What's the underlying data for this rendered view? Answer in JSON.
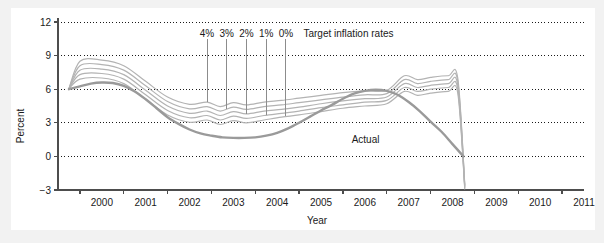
{
  "chart_data": {
    "type": "line",
    "title": "",
    "xlabel": "Year",
    "ylabel": "Percent",
    "xlim": [
      1999.5,
      2011.5
    ],
    "ylim": [
      -3,
      12
    ],
    "yticks": [
      -3,
      0,
      3,
      6,
      9,
      12
    ],
    "ytick_labels": [
      "−3",
      "0",
      "3",
      "6",
      "9",
      "12"
    ],
    "xticks": [
      2000,
      2001,
      2002,
      2003,
      2004,
      2005,
      2006,
      2007,
      2008,
      2009,
      2010,
      2011
    ],
    "xtick_labels": [
      "2000",
      "2001",
      "2002",
      "2003",
      "2004",
      "2005",
      "2006",
      "2007",
      "2008",
      "2009",
      "2010",
      "2011"
    ],
    "grid": "horizontal-dotted",
    "legend_position": "inline-annotations",
    "annotations": [
      {
        "text": "4%",
        "x": 2002.9,
        "y": 11.0
      },
      {
        "text": "3%",
        "x": 2003.35,
        "y": 11.0
      },
      {
        "text": "2%",
        "x": 2003.8,
        "y": 11.0
      },
      {
        "text": "1%",
        "x": 2004.25,
        "y": 11.0
      },
      {
        "text": "0%",
        "x": 2004.7,
        "y": 11.0
      },
      {
        "text": "Target inflation rates",
        "x": 2005.1,
        "y": 11.0
      },
      {
        "text": "Actual",
        "x": 2006.2,
        "y": 1.55
      }
    ],
    "series": [
      {
        "name": "Actual",
        "color": "#9a9a9a",
        "width": 2.4,
        "x": [
          1999.75,
          2000.0,
          2000.25,
          2000.5,
          2000.75,
          2001.0,
          2001.25,
          2001.5,
          2001.75,
          2002.0,
          2002.25,
          2002.5,
          2002.75,
          2003.0,
          2003.25,
          2003.5,
          2003.75,
          2004.0,
          2004.25,
          2004.5,
          2004.75,
          2005.0,
          2005.25,
          2005.5,
          2005.75,
          2006.0,
          2006.25,
          2006.5,
          2006.75,
          2007.0,
          2007.25,
          2007.5,
          2007.75,
          2008.0,
          2008.25,
          2008.5,
          2008.75
        ],
        "values": [
          6.0,
          6.25,
          6.5,
          6.6,
          6.55,
          6.3,
          5.8,
          5.1,
          4.3,
          3.5,
          2.9,
          2.4,
          2.05,
          1.85,
          1.7,
          1.65,
          1.65,
          1.7,
          1.85,
          2.1,
          2.5,
          3.0,
          3.55,
          4.1,
          4.6,
          5.15,
          5.6,
          5.85,
          5.95,
          5.85,
          5.5,
          4.85,
          4.05,
          3.1,
          2.2,
          1.1,
          0.0
        ]
      },
      {
        "name": "4% target path",
        "color": "#b3b3b3",
        "width": 1.2,
        "x": [
          1999.75,
          2000.0,
          2000.5,
          2001.0,
          2001.5,
          2002.0,
          2002.5,
          2002.9,
          2003.2,
          2003.5,
          2003.8,
          2004.2,
          2004.6,
          2005.0,
          2005.5,
          2006.0,
          2006.5,
          2007.0,
          2007.4,
          2007.7,
          2008.0,
          2008.4,
          2008.62,
          2008.78
        ],
        "values": [
          6.05,
          8.5,
          8.6,
          8.1,
          6.7,
          5.3,
          4.65,
          4.85,
          4.45,
          4.8,
          4.6,
          4.85,
          5.0,
          5.2,
          5.45,
          5.7,
          5.85,
          5.9,
          7.2,
          6.85,
          7.05,
          7.2,
          7.0,
          -2.5
        ]
      },
      {
        "name": "3% target path",
        "color": "#b3b3b3",
        "width": 1.2,
        "x": [
          1999.75,
          2000.0,
          2000.5,
          2001.0,
          2001.5,
          2002.0,
          2002.5,
          2002.9,
          2003.2,
          2003.5,
          2003.8,
          2004.2,
          2004.6,
          2005.0,
          2005.5,
          2006.0,
          2006.5,
          2007.0,
          2007.4,
          2007.7,
          2008.0,
          2008.4,
          2008.62,
          2008.78
        ],
        "values": [
          6.05,
          8.1,
          8.2,
          7.7,
          6.3,
          4.9,
          4.25,
          4.45,
          4.05,
          4.4,
          4.2,
          4.45,
          4.6,
          4.8,
          5.05,
          5.3,
          5.5,
          5.6,
          6.85,
          6.5,
          6.7,
          6.85,
          6.7,
          -2.6
        ]
      },
      {
        "name": "2% target path",
        "color": "#b3b3b3",
        "width": 1.2,
        "x": [
          1999.75,
          2000.0,
          2000.5,
          2001.0,
          2001.5,
          2002.0,
          2002.5,
          2002.9,
          2003.2,
          2003.5,
          2003.8,
          2004.2,
          2004.6,
          2005.0,
          2005.5,
          2006.0,
          2006.5,
          2007.0,
          2007.4,
          2007.7,
          2008.0,
          2008.4,
          2008.62,
          2008.78
        ],
        "values": [
          6.05,
          7.7,
          7.8,
          7.3,
          5.9,
          4.5,
          3.85,
          4.05,
          3.65,
          4.0,
          3.8,
          4.05,
          4.2,
          4.4,
          4.7,
          4.95,
          5.15,
          5.3,
          6.5,
          6.15,
          6.35,
          6.5,
          6.35,
          -2.7
        ]
      },
      {
        "name": "1% target path",
        "color": "#b3b3b3",
        "width": 1.2,
        "x": [
          1999.75,
          2000.0,
          2000.5,
          2001.0,
          2001.5,
          2002.0,
          2002.5,
          2002.9,
          2003.2,
          2003.5,
          2003.8,
          2004.2,
          2004.6,
          2005.0,
          2005.5,
          2006.0,
          2006.5,
          2007.0,
          2007.4,
          2007.7,
          2008.0,
          2008.4,
          2008.62,
          2008.78
        ],
        "values": [
          6.05,
          7.3,
          7.4,
          6.9,
          5.5,
          4.1,
          3.45,
          3.65,
          3.25,
          3.6,
          3.4,
          3.65,
          3.85,
          4.05,
          4.35,
          4.6,
          4.85,
          5.0,
          6.15,
          5.8,
          6.0,
          6.15,
          6.0,
          -2.8
        ]
      },
      {
        "name": "0% target path",
        "color": "#b3b3b3",
        "width": 1.2,
        "x": [
          1999.75,
          2000.0,
          2000.5,
          2001.0,
          2001.5,
          2002.0,
          2002.5,
          2002.9,
          2003.2,
          2003.5,
          2003.8,
          2004.2,
          2004.6,
          2005.0,
          2005.5,
          2006.0,
          2006.5,
          2007.0,
          2007.4,
          2007.7,
          2008.0,
          2008.4,
          2008.62,
          2008.78
        ],
        "values": [
          6.05,
          6.9,
          7.0,
          6.5,
          5.1,
          3.7,
          3.05,
          3.25,
          2.85,
          3.2,
          3.0,
          3.25,
          3.5,
          3.7,
          4.0,
          4.3,
          4.5,
          4.7,
          5.8,
          5.45,
          5.65,
          5.8,
          5.65,
          -2.9
        ]
      }
    ],
    "leader_lines": [
      {
        "label": "4%",
        "x": 2002.9,
        "y_top": 10.45,
        "y_bottom": 4.85
      },
      {
        "label": "3%",
        "x": 2003.35,
        "y_top": 10.45,
        "y_bottom": 4.2
      },
      {
        "label": "2%",
        "x": 2003.8,
        "y_top": 10.45,
        "y_bottom": 3.8
      },
      {
        "label": "1%",
        "x": 2004.25,
        "y_top": 10.45,
        "y_bottom": 3.72
      },
      {
        "label": "0%",
        "x": 2004.7,
        "y_top": 10.45,
        "y_bottom": 3.58
      }
    ]
  },
  "colors": {
    "page_background": "#f2f2f2",
    "panel_background": "#ffffff",
    "axis": "#4d4d4d",
    "gridline": "#1a1a1a",
    "fan_line": "#b3b3b3",
    "actual_line": "#9a9a9a",
    "text": "#1a1a1a"
  }
}
